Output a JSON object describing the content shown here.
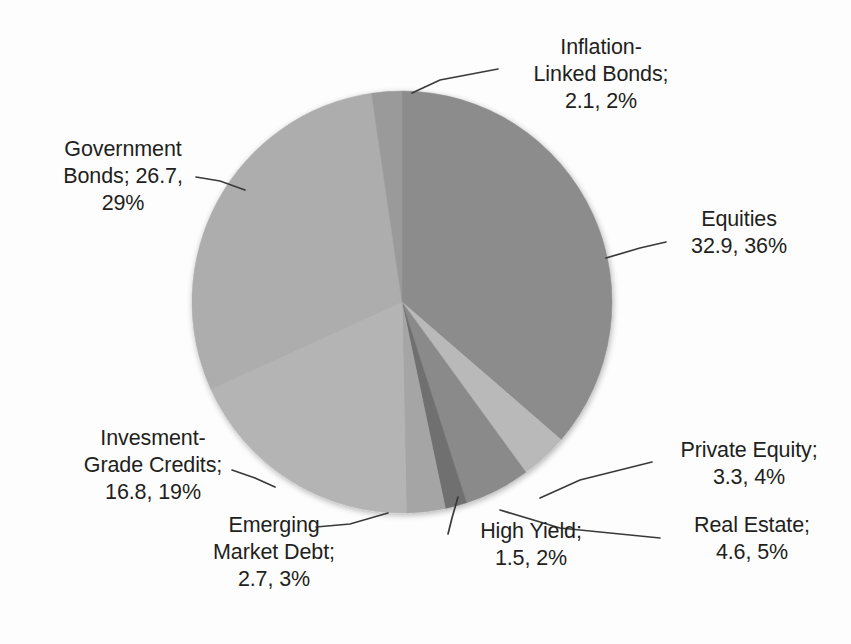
{
  "chart_data": {
    "type": "pie",
    "title": "",
    "subtitle": "",
    "xlabel": "",
    "ylabel": "",
    "legend_position": "none",
    "grid": false,
    "label_format": "name; value, percent",
    "total": 92.6,
    "start_angle_deg": 0,
    "direction": "clockwise",
    "categories": [
      "Equities",
      "Private Equity",
      "Real Estate",
      "High Yield",
      "Emerging Market Debt",
      "Invesment-Grade Credits",
      "Government Bonds",
      "Inflation-Linked Bonds"
    ],
    "values": [
      32.9,
      3.3,
      4.6,
      1.5,
      2.7,
      16.8,
      26.7,
      2.1
    ],
    "percents": [
      36,
      4,
      5,
      2,
      3,
      19,
      29,
      2
    ],
    "colors": [
      "#8c8c8c",
      "#b9b9b9",
      "#8a8a8a",
      "#6f6f6f",
      "#a5a5a5",
      "#b4b4b4",
      "#adadad",
      "#9a9a9a"
    ],
    "slices": [
      {
        "name": "Equities",
        "value": 32.9,
        "percent": 36,
        "color": "#8c8c8c"
      },
      {
        "name": "Private Equity",
        "value": 3.3,
        "percent": 4,
        "color": "#b9b9b9"
      },
      {
        "name": "Real Estate",
        "value": 4.6,
        "percent": 5,
        "color": "#8a8a8a"
      },
      {
        "name": "High Yield",
        "value": 1.5,
        "percent": 2,
        "color": "#6f6f6f"
      },
      {
        "name": "Emerging Market Debt",
        "value": 2.7,
        "percent": 3,
        "color": "#a5a5a5"
      },
      {
        "name": "Invesment-Grade Credits",
        "value": 16.8,
        "percent": 19,
        "color": "#b4b4b4"
      },
      {
        "name": "Government Bonds",
        "value": 26.7,
        "percent": 29,
        "color": "#adadad"
      },
      {
        "name": "Inflation-Linked Bonds",
        "value": 2.1,
        "percent": 2,
        "color": "#9a9a9a"
      }
    ]
  },
  "labels": {
    "inflation_linked_bonds": "Inflation-\nLinked Bonds;\n2.1, 2%",
    "equities": "Equities\n32.9, 36%",
    "private_equity": "Private Equity;\n3.3, 4%",
    "real_estate": "Real Estate;\n4.6, 5%",
    "high_yield": "High Yield;\n1.5, 2%",
    "emerging_market_debt": "Emerging\nMarket Debt;\n2.7, 3%",
    "investment_grade_credits": "Invesment-\nGrade Credits;\n16.8, 19%",
    "government_bonds": "Government\nBonds; 26.7,\n29%"
  },
  "geometry": {
    "center_x": 402,
    "center_y": 302,
    "radius_x": 210,
    "radius_y": 211
  },
  "style": {
    "background": "#fdfdfd",
    "text_color": "#231f20",
    "leader_line_color": "#3a3a3a"
  }
}
